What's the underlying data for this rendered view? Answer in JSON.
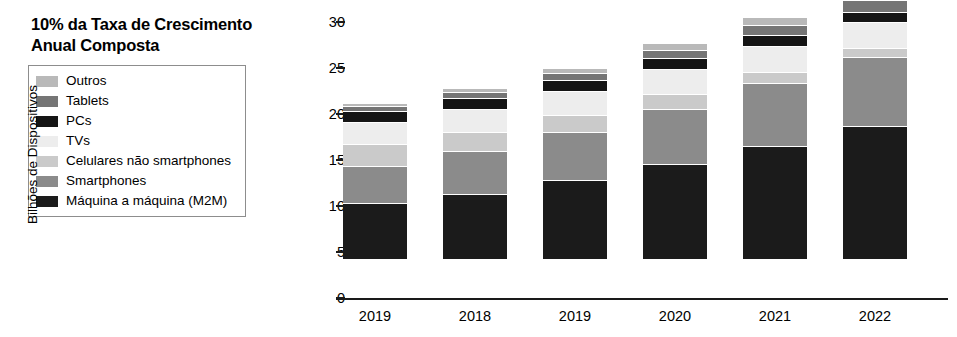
{
  "title": "10% da Taxa de Crescimento Anual Composta",
  "legend": {
    "items": [
      {
        "label": "Outros",
        "color": "#b9b9b9",
        "key": "outros"
      },
      {
        "label": "Tablets",
        "color": "#757575",
        "key": "tablets"
      },
      {
        "label": "PCs",
        "color": "#151515",
        "key": "pcs"
      },
      {
        "label": "TVs",
        "color": "#ededed",
        "key": "tvs"
      },
      {
        "label": "Celulares não smartphones",
        "color": "#cacaca",
        "key": "celulares"
      },
      {
        "label": "Smartphones",
        "color": "#8b8b8b",
        "key": "smartphones"
      },
      {
        "label": "Máquina a máquina (M2M)",
        "color": "#1b1b1b",
        "key": "m2m"
      }
    ]
  },
  "axis": {
    "ylabel": "Bilhões de Dispositivos",
    "yticks": [
      "0",
      "5",
      "10",
      "15",
      "20",
      "25",
      "30"
    ],
    "ymin": 0,
    "ymax": 30,
    "xticks": [
      "2019",
      "2018",
      "2019",
      "2020",
      "2021",
      "2022"
    ]
  },
  "chart_data": {
    "type": "bar",
    "stacked": true,
    "title": "10% da Taxa de Crescimento Anual Composta",
    "xlabel": "",
    "ylabel": "Bilhões de Dispositivos",
    "ylim": [
      0,
      30
    ],
    "ytick_values": [
      0,
      5,
      10,
      15,
      20,
      25,
      30
    ],
    "grid": false,
    "legend_position": "left-outside",
    "categories": [
      "2019",
      "2018",
      "2019",
      "2020",
      "2021",
      "2022"
    ],
    "stack_order_bottom_to_top": [
      "Máquina a máquina (M2M)",
      "Smartphones",
      "Celulares não smartphones",
      "TVs",
      "PCs",
      "Tablets",
      "Outros"
    ],
    "series": [
      {
        "name": "Máquina a máquina (M2M)",
        "color": "#1b1b1b",
        "values": [
          6.0,
          7.0,
          8.5,
          10.2,
          12.2,
          14.3
        ]
      },
      {
        "name": "Smartphones",
        "color": "#8b8b8b",
        "values": [
          4.0,
          4.6,
          5.2,
          6.0,
          6.8,
          7.6
        ]
      },
      {
        "name": "Celulares não smartphones",
        "color": "#cacaca",
        "values": [
          2.4,
          2.1,
          1.9,
          1.6,
          1.2,
          0.9
        ]
      },
      {
        "name": "TVs",
        "color": "#ededed",
        "values": [
          2.4,
          2.5,
          2.6,
          2.7,
          2.8,
          2.9
        ]
      },
      {
        "name": "PCs",
        "color": "#151515",
        "values": [
          1.2,
          1.2,
          1.2,
          1.2,
          1.2,
          1.1
        ]
      },
      {
        "name": "Tablets",
        "color": "#757575",
        "values": [
          0.5,
          0.6,
          0.7,
          0.9,
          1.1,
          1.2
        ]
      },
      {
        "name": "Outros",
        "color": "#b9b9b9",
        "values": [
          0.4,
          0.5,
          0.6,
          0.8,
          0.9,
          1.0
        ]
      }
    ],
    "totals": [
      16.9,
      18.5,
      20.7,
      23.4,
      26.2,
      29.0
    ]
  }
}
